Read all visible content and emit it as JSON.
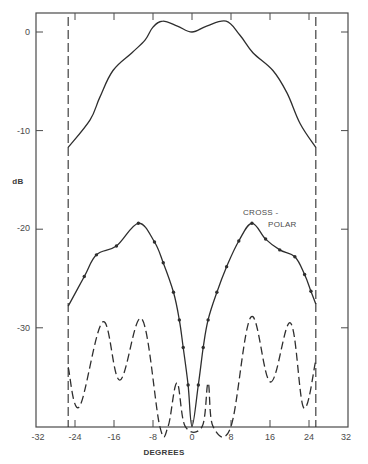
{
  "chart_data": {
    "type": "line",
    "title": "",
    "xlabel": "DEGREES",
    "ylabel": "dB",
    "xlim": [
      -32,
      32
    ],
    "ylim": [
      -40,
      2
    ],
    "xticks": [
      -32,
      -24,
      -16,
      -8,
      0,
      8,
      16,
      24,
      32
    ],
    "xtick_labels": [
      "-32",
      "-24",
      "-16",
      "-8",
      "0",
      "8",
      "16",
      "24",
      "32"
    ],
    "yticks": [
      0,
      -10,
      -20,
      -30
    ],
    "ytick_labels": [
      "0",
      "-10",
      "-20",
      "-30"
    ],
    "grid": false,
    "annotations": [
      {
        "text": "CROSS -",
        "x": 12.5,
        "y": -18.2
      },
      {
        "text": "POLAR",
        "x": 17.0,
        "y": -19.4
      }
    ],
    "vertical_lines": [
      {
        "x": -25.4,
        "style": "dashed",
        "name": "left-edge-marker"
      },
      {
        "x": 25.4,
        "style": "dashed",
        "name": "right-edge-marker"
      }
    ],
    "series": [
      {
        "name": "Co-polar",
        "style": "solid",
        "markers": false,
        "x": [
          -25.4,
          -20.9,
          -18.9,
          -16.2,
          -12.3,
          -9.6,
          -8.0,
          -6.0,
          -3.0,
          0.0,
          3.0,
          7.0,
          9.8,
          12.5,
          16.6,
          19.5,
          22.2,
          25.4
        ],
        "y": [
          -11.7,
          -8.9,
          -6.6,
          -3.9,
          -2.1,
          -0.8,
          0.5,
          1.1,
          0.6,
          0.0,
          0.6,
          1.1,
          -0.3,
          -2.1,
          -3.9,
          -6.2,
          -9.3,
          -11.7
        ]
      },
      {
        "name": "Cross-polar",
        "style": "solid",
        "markers": true,
        "x": [
          -25.4,
          -22.1,
          -19.6,
          -15.5,
          -11.0,
          -7.7,
          -5.9,
          -3.8,
          -2.6,
          -1.8,
          -0.8,
          0.0,
          1.3,
          2.3,
          3.3,
          5.1,
          7.1,
          9.6,
          12.3,
          15.1,
          18.0,
          21.1,
          23.1,
          24.4,
          25.4
        ],
        "y": [
          -27.8,
          -24.8,
          -22.6,
          -21.7,
          -19.4,
          -21.3,
          -23.4,
          -26.4,
          -29.2,
          -32.0,
          -35.8,
          -40.0,
          -35.8,
          -32.0,
          -29.2,
          -26.4,
          -23.8,
          -21.2,
          -19.4,
          -21.0,
          -22.1,
          -22.8,
          -24.6,
          -26.3,
          -27.6
        ]
      },
      {
        "name": "Dashed (co-polar reference)",
        "style": "dashed",
        "markers": false,
        "x": [
          -25.4,
          -23.1,
          -18.3,
          -14.8,
          -10.3,
          -6.6,
          -4.9,
          -3.1,
          -1.4,
          2.1,
          3.3,
          4.3,
          8.0,
          12.1,
          16.1,
          20.2,
          22.9,
          25.4
        ],
        "y": [
          -34.0,
          -38.0,
          -29.4,
          -35.3,
          -29.1,
          -40.0,
          -40.0,
          -35.6,
          -40.0,
          -40.0,
          -35.6,
          -40.0,
          -40.0,
          -28.9,
          -35.5,
          -29.5,
          -38.1,
          -33.3
        ]
      }
    ]
  },
  "labels": {
    "ylabel": "dB",
    "xlabel": "DEGREES",
    "annotation_line1": "CROSS -",
    "annotation_line2": "POLAR",
    "xtick": [
      "-32",
      "-24",
      "-16",
      "-8",
      "0",
      "8",
      "16",
      "24",
      "32"
    ],
    "ytick": [
      "0",
      "-10",
      "-20",
      "-30"
    ]
  },
  "colors": {
    "ink": "#2e2e2e",
    "axis": "#4a4a4a",
    "background": "#ffffff"
  }
}
